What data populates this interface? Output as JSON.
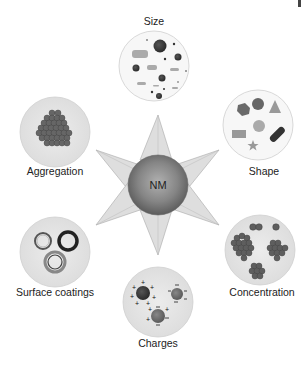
{
  "diagram": {
    "center": {
      "label": "NM"
    },
    "properties": [
      {
        "id": "size",
        "label": "Size"
      },
      {
        "id": "shape",
        "label": "Shape"
      },
      {
        "id": "concentration",
        "label": "Concentration"
      },
      {
        "id": "charges",
        "label": "Charges"
      },
      {
        "id": "surface-coatings",
        "label": "Surface coatings"
      },
      {
        "id": "aggregation",
        "label": "Aggregation"
      }
    ]
  },
  "colors": {
    "circle_fill": "#e6e6e6",
    "circle_stroke": "#c8c8c8",
    "star_fill": "#dcdcdc",
    "particle_dark": "#3c3c3c",
    "particle_mid": "#6a6a6a",
    "particle_light": "#a8a8a8"
  }
}
